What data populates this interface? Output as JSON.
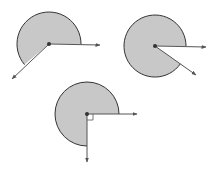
{
  "diagram": {
    "colors": {
      "fill": "#c8c8c8",
      "stroke": "#333333",
      "ray": "#555555"
    },
    "figures": [
      {
        "id": "angle-1",
        "center": [
          49,
          44
        ],
        "radius": 32,
        "start_ray_end": [
          100,
          45
        ],
        "end_ray_end": [
          12,
          79
        ],
        "reflex_measure_deg": 220,
        "right_angle_marker": false
      },
      {
        "id": "angle-2",
        "center": [
          155,
          46
        ],
        "radius": 31,
        "start_ray_end": [
          206,
          47
        ],
        "end_ray_end": [
          196,
          75
        ],
        "reflex_measure_deg": 325,
        "right_angle_marker": false
      },
      {
        "id": "angle-3",
        "center": [
          87,
          114
        ],
        "radius": 32,
        "start_ray_end": [
          137,
          114
        ],
        "end_ray_end": [
          87,
          162
        ],
        "reflex_measure_deg": 270,
        "right_angle_marker": true
      }
    ]
  }
}
